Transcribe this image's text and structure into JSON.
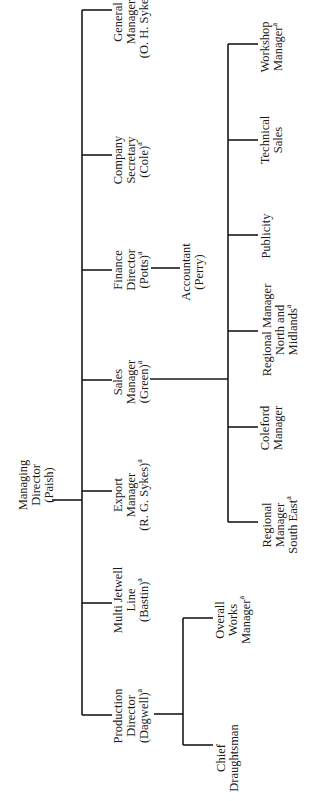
{
  "chart": {
    "orientation": "rotated 90 degrees counter-clockwise",
    "footnote_marker": "a",
    "root": {
      "id": "md",
      "lines": [
        "Managing",
        "Director",
        "(Paish)"
      ],
      "children": [
        {
          "id": "gm",
          "lines": [
            "General",
            "Manager",
            "(O. H. Sykes)"
          ],
          "marked": true
        },
        {
          "id": "cs",
          "lines": [
            "Company",
            "Secretary",
            "(Cole)"
          ],
          "marked": true
        },
        {
          "id": "fd",
          "lines": [
            "Finance",
            "Director",
            "(Potts)"
          ],
          "marked": true,
          "children": [
            {
              "id": "acc",
              "lines": [
                "Accountant",
                "(Perry)"
              ],
              "marked": false
            }
          ]
        },
        {
          "id": "sm",
          "lines": [
            "Sales",
            "Manager",
            "(Green)"
          ],
          "marked": true,
          "children": [
            {
              "id": "wm",
              "lines": [
                "Workshop",
                "Manager"
              ],
              "marked": true
            },
            {
              "id": "ts",
              "lines": [
                "Technical",
                "Sales"
              ],
              "marked": false
            },
            {
              "id": "pub",
              "lines": [
                "Publicity"
              ],
              "marked": false
            },
            {
              "id": "rnm",
              "lines": [
                "Regional Manager",
                "North and",
                "Midlands"
              ],
              "marked": true
            },
            {
              "id": "cm",
              "lines": [
                "Coleford",
                "Manager"
              ],
              "marked": false
            },
            {
              "id": "rse",
              "lines": [
                "Regional",
                "Manager",
                "South East"
              ],
              "marked": true
            }
          ]
        },
        {
          "id": "em",
          "lines": [
            "Export",
            "Manager",
            "(R. G. Sykes)"
          ],
          "marked": true
        },
        {
          "id": "mj",
          "lines": [
            "Multi Jetwell",
            "Line",
            "(Bastin)"
          ],
          "marked": true
        },
        {
          "id": "pd",
          "lines": [
            "Production",
            "Director",
            "(Dagwell)"
          ],
          "marked": true,
          "children": [
            {
              "id": "owm",
              "lines": [
                "Overall",
                "Works",
                "Manager"
              ],
              "marked": true
            },
            {
              "id": "cd",
              "lines": [
                "Chief",
                "Draughtsman"
              ],
              "marked": false
            }
          ]
        }
      ]
    }
  },
  "labels": {
    "md": [
      "Managing",
      "Director",
      "(Paish)"
    ],
    "gm": [
      "General",
      "Manager",
      "(O. H. Sykes)a"
    ],
    "cs": [
      "Company",
      "Secretary",
      "(Cole)a"
    ],
    "fd": [
      "Finance",
      "Director",
      "(Potts)a"
    ],
    "acc": [
      "Accountant",
      "(Perry)"
    ],
    "sm": [
      "Sales",
      "Manager",
      "(Green)a"
    ],
    "wm": [
      "Workshop",
      "Managera"
    ],
    "ts": [
      "Technical",
      "Sales"
    ],
    "pub": [
      "Publicity"
    ],
    "rnm": [
      "Regional Manager",
      "North and",
      "Midlandsa"
    ],
    "cm": [
      "Coleford",
      "Manager"
    ],
    "rse": [
      "Regional",
      "Manager",
      "South Easta"
    ],
    "em": [
      "Export",
      "Manager",
      "(R. G. Sykes)a"
    ],
    "mj": [
      "Multi Jetwell",
      "Line",
      "(Bastin)a"
    ],
    "pd": [
      "Production",
      "Director",
      "(Dagwell)a"
    ],
    "owm": [
      "Overall",
      "Works",
      "Managera"
    ],
    "cd": [
      "Chief",
      "Draughtsman"
    ]
  },
  "colors": {
    "line": "#1a1a1a",
    "text": "#1a1a1a",
    "background": "#ffffff"
  }
}
